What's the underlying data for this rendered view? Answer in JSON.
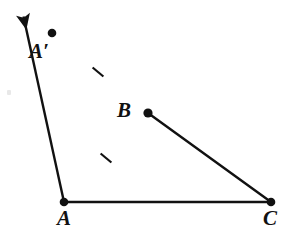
{
  "figure": {
    "kind": "geometry-diagram",
    "width": 296,
    "height": 241,
    "background_color": "#ffffff",
    "stroke_color": "#111111"
  },
  "labels": {
    "a_prime": "A′",
    "b": "B",
    "a": "A",
    "c": "C"
  },
  "points": {
    "arrow_tip": {
      "x": 19,
      "y": 13
    },
    "a_prime": {
      "x": 52,
      "y": 33
    },
    "b": {
      "x": 148,
      "y": 113
    },
    "a": {
      "x": 64,
      "y": 202
    },
    "c": {
      "x": 271,
      "y": 202
    }
  },
  "segments": [
    {
      "name": "ray-through-b-to-arrow",
      "from": "a",
      "to": "arrow_tip",
      "marked": true
    },
    {
      "name": "segment-ab",
      "from": "a",
      "to": "b",
      "marked": true
    },
    {
      "name": "segment-bc",
      "from": "b",
      "to": "c",
      "marked": false
    },
    {
      "name": "segment-ac",
      "from": "a",
      "to": "c",
      "marked": false
    }
  ],
  "tick_marks": [
    {
      "name": "tick-on-b-a-prime",
      "x": 98,
      "y": 72
    },
    {
      "name": "tick-on-ab",
      "x": 106,
      "y": 158
    }
  ],
  "style": {
    "line_width": 2.4,
    "vertex_dot_radius": 4.2,
    "tick_length": 13,
    "tick_width": 2.2
  }
}
